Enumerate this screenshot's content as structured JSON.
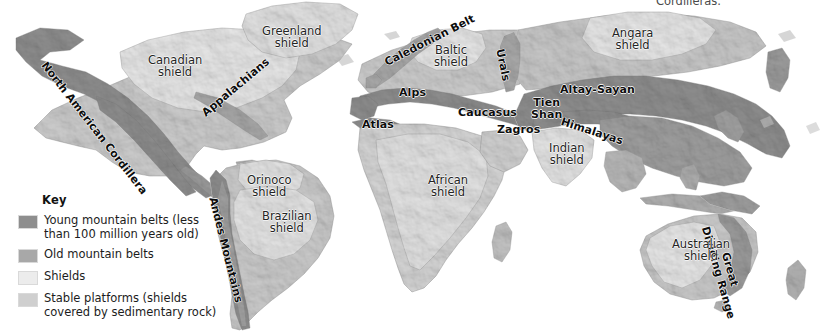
{
  "figure": {
    "type": "thematic-world-map",
    "title_cut_off_top": "Cordilleras.",
    "background_color": "#ffffff",
    "width": 838,
    "height": 335
  },
  "legend": {
    "title": "Key",
    "items": [
      {
        "label": "Young mountain belts (less\nthan 100 million years old)",
        "color": "#8e8e8e",
        "name": "young-mountain-belts"
      },
      {
        "label": "Old mountain belts",
        "color": "#a8a8a8",
        "name": "old-mountain-belts"
      },
      {
        "label": "Shields",
        "color": "#ececec",
        "name": "shields"
      },
      {
        "label": "Stable platforms (shields\ncovered by sedimentary rock)",
        "color": "#cfcfcf",
        "name": "stable-platforms"
      }
    ]
  },
  "map_colors": {
    "young_belt": "#8e8e8e",
    "old_belt": "#a8a8a8",
    "shield": "#e9e9e9",
    "platform": "#cdcdcd",
    "ocean": "#ffffff",
    "outline": "#9a9a9a"
  },
  "labels": {
    "mountain_belts": [
      {
        "text": "North American Cordillera",
        "x": 48,
        "y": 60,
        "rotate": 52,
        "name": "label-north-american-cordillera"
      },
      {
        "text": "Appalachians",
        "x": 200,
        "y": 110,
        "rotate": -40,
        "name": "label-appalachians"
      },
      {
        "text": "Andes Mountains",
        "x": 218,
        "y": 196,
        "rotate": 76,
        "name": "label-andes-mountains"
      },
      {
        "text": "Caledonian Belt",
        "x": 383,
        "y": 58,
        "rotate": -27,
        "name": "label-caledonian-belt"
      },
      {
        "text": "Alps",
        "x": 399,
        "y": 87,
        "rotate": 0,
        "name": "label-alps"
      },
      {
        "text": "Atlas",
        "x": 362,
        "y": 119,
        "rotate": 0,
        "name": "label-atlas"
      },
      {
        "text": "Urals",
        "x": 505,
        "y": 48,
        "rotate": 78,
        "name": "label-urals"
      },
      {
        "text": "Caucasus",
        "x": 458,
        "y": 107,
        "rotate": 0,
        "name": "label-caucasus"
      },
      {
        "text": "Zagros",
        "x": 497,
        "y": 124,
        "rotate": 0,
        "name": "label-zagros"
      },
      {
        "text": "Altay-Sayan",
        "x": 560,
        "y": 84,
        "rotate": 0,
        "name": "label-altay-sayan"
      },
      {
        "text": "Tien\nShan",
        "x": 531,
        "y": 97,
        "rotate": 0,
        "name": "label-tien-shan"
      },
      {
        "text": "Himalayas",
        "x": 563,
        "y": 116,
        "rotate": 18,
        "name": "label-himalayas"
      },
      {
        "text": "Great\nDividing Range",
        "x": 722,
        "y": 222,
        "rotate": 74,
        "name": "label-great-dividing-range"
      }
    ],
    "shields": [
      {
        "text": "Greenland\nshield",
        "x": 262,
        "y": 25,
        "name": "label-greenland-shield"
      },
      {
        "text": "Canadian\nshield",
        "x": 148,
        "y": 54,
        "name": "label-canadian-shield"
      },
      {
        "text": "Baltic\nshield",
        "x": 434,
        "y": 44,
        "name": "label-baltic-shield"
      },
      {
        "text": "Angara\nshield",
        "x": 612,
        "y": 27,
        "name": "label-angara-shield"
      },
      {
        "text": "Orinoco\nshield",
        "x": 247,
        "y": 174,
        "name": "label-orinoco-shield"
      },
      {
        "text": "Brazilian\nshield",
        "x": 262,
        "y": 210,
        "name": "label-brazilian-shield"
      },
      {
        "text": "African\nshield",
        "x": 428,
        "y": 174,
        "name": "label-african-shield"
      },
      {
        "text": "Indian\nshield",
        "x": 549,
        "y": 142,
        "name": "label-indian-shield"
      },
      {
        "text": "Australian\nshield",
        "x": 672,
        "y": 238,
        "name": "label-australian-shield"
      }
    ]
  }
}
